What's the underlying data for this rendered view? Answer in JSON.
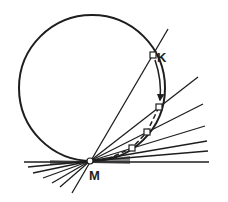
{
  "diagram": {
    "colors": {
      "ink": "#1e1e1e",
      "background": "#ffffff"
    },
    "labels": {
      "K": "K",
      "M": "M"
    },
    "circle": {
      "cx": 92,
      "cy": 88,
      "r": 73
    },
    "points": {
      "M": {
        "x": 90,
        "y": 161
      },
      "K": {
        "x": 153,
        "y": 55
      },
      "P1": {
        "x": 159,
        "y": 107
      },
      "P2": {
        "x": 147,
        "y": 132
      },
      "P3": {
        "x": 132,
        "y": 148
      }
    },
    "secant_line": {
      "x1": 72,
      "y1": 193,
      "x2": 168,
      "y2": 29
    },
    "rays_right": [
      {
        "x2": 198,
        "y2": 77
      },
      {
        "x2": 203,
        "y2": 104
      },
      {
        "x2": 205,
        "y2": 126
      },
      {
        "x2": 207,
        "y2": 141
      },
      {
        "x2": 208,
        "y2": 151
      },
      {
        "x2": 209,
        "y2": 162
      }
    ],
    "rays_left": [
      {
        "x2": 24,
        "y2": 163
      },
      {
        "x2": 28,
        "y2": 167
      },
      {
        "x2": 33,
        "y2": 173
      },
      {
        "x2": 43,
        "y2": 178
      },
      {
        "x2": 52,
        "y2": 183
      },
      {
        "x2": 60,
        "y2": 187
      }
    ]
  }
}
